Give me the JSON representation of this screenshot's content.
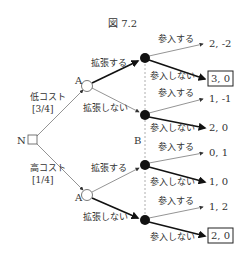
{
  "title": "図 7.2",
  "nature": {
    "label": "N"
  },
  "player_a": {
    "label": "A"
  },
  "player_b": {
    "label": "B"
  },
  "branches": {
    "low_cost": {
      "label": "低コスト",
      "prob": "[3/4]"
    },
    "high_cost": {
      "label": "高コスト",
      "prob": "[1/4]"
    }
  },
  "actions": {
    "expand": "拡張する",
    "not_expand": "拡張しない",
    "enter": "参入する",
    "not_enter": "参入しない"
  },
  "payoffs": [
    {
      "value": "2, -2",
      "boxed": false
    },
    {
      "value": "3, 0",
      "boxed": true
    },
    {
      "value": "1, -1",
      "boxed": false
    },
    {
      "value": "2, 0",
      "boxed": false
    },
    {
      "value": "0, 1",
      "boxed": false
    },
    {
      "value": "1, 0",
      "boxed": false
    },
    {
      "value": "1, 2",
      "boxed": false
    },
    {
      "value": "2, 0",
      "boxed": true
    }
  ]
}
